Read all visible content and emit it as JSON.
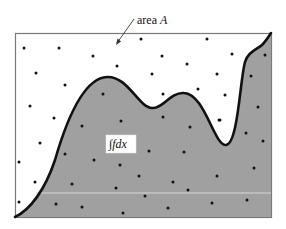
{
  "diagram": {
    "area_label": {
      "text": "area ",
      "variable": "A"
    },
    "integral_label": "∫fdx",
    "colors": {
      "frame": "#7a7a7a",
      "curve": "#111111",
      "under_fill": "#a0a0a0",
      "dot": "#111111",
      "label_box": "#ffffff"
    },
    "sample_points_count": 50
  }
}
